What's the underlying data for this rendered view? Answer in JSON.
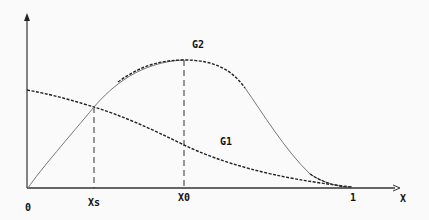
{
  "diagram": {
    "type": "function-curves",
    "axes": {
      "x_label": "X",
      "origin_label": "0",
      "tick_labels": [
        {
          "id": "xs",
          "text": "Xs"
        },
        {
          "id": "x0",
          "text": "X0"
        },
        {
          "id": "one",
          "text": "1"
        }
      ]
    },
    "curves": [
      {
        "name": "G1",
        "label": "G1",
        "style": "dashed",
        "description": "decreasing curve from y-axis to 1"
      },
      {
        "name": "G2",
        "label": "G2",
        "style": "solid/dashed",
        "description": "rises from origin, peaks at X0, falls to 1"
      }
    ],
    "markers": [
      {
        "name": "xs-line",
        "at": "Xs",
        "description": "intersection of G1 and G2"
      },
      {
        "name": "x0-line",
        "at": "X0",
        "description": "maximum of G2"
      }
    ],
    "colors": {
      "line": "#222222",
      "thin": "#777777",
      "background": "#fafafa"
    }
  }
}
